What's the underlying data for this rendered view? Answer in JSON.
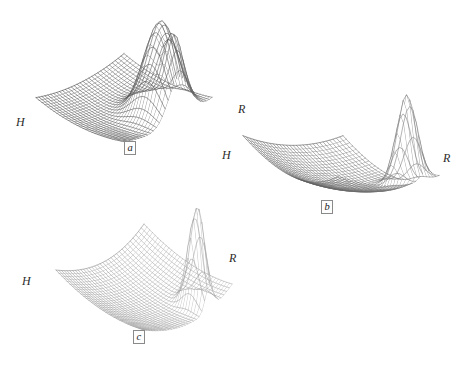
{
  "figure": {
    "type": "multi-panel-3d-surface-figure",
    "background_color": "#ffffff",
    "ink_color": "#303030",
    "panel_count": 3
  },
  "chart_data": {
    "type": "surface",
    "title": "",
    "subtitle": "",
    "xlabel": "R",
    "ylabel": "H",
    "zlabel": "",
    "grid": true,
    "legend_position": "none",
    "render_style": "wireframe-mesh",
    "projection": "oblique-3d",
    "panels": [
      {
        "id": "a",
        "tag": "a",
        "axis_left_label": "H",
        "axis_right_label": "R",
        "surface_tone": "dark",
        "mesh_rows": 30,
        "mesh_cols": 30,
        "base_level": 0.0,
        "peaks": [
          {
            "name": "primary-peak",
            "x": 0.62,
            "y": 0.8,
            "height": 1.0,
            "sigma_x": 0.12,
            "sigma_y": 0.16
          },
          {
            "name": "secondary-peak",
            "x": 0.83,
            "y": 0.74,
            "height": 0.52,
            "sigma_x": 0.055,
            "sigma_y": 0.085
          }
        ],
        "corner_screen_positions": {
          "left_H": [
            33,
            122
          ],
          "right_R": [
            214,
            110
          ],
          "front": [
            128,
            156
          ],
          "back": [
            118,
            66
          ]
        }
      },
      {
        "id": "b",
        "tag": "b",
        "axis_left_label": "H",
        "axis_right_label": "R",
        "surface_tone": "medium-dark",
        "mesh_rows": 30,
        "mesh_cols": 30,
        "base_level": 0.0,
        "peaks": [
          {
            "name": "primary-peak",
            "x": 0.87,
            "y": 0.8,
            "height": 1.0,
            "sigma_x": 0.055,
            "sigma_y": 0.095
          }
        ],
        "ridge": {
          "name": "back-ridge",
          "amplitude": 0.3,
          "axis": "y"
        },
        "corner_screen_positions": {
          "left_H": [
            240,
            155
          ],
          "right_R": [
            436,
            160
          ],
          "front": [
            328,
            222
          ],
          "back": [
            318,
            92
          ]
        }
      },
      {
        "id": "c",
        "tag": "c",
        "axis_left_label": "H",
        "axis_right_label": "R",
        "surface_tone": "light",
        "mesh_rows": 32,
        "mesh_cols": 32,
        "base_level": 0.0,
        "peaks": [
          {
            "name": "primary-peak",
            "x": 0.74,
            "y": 0.86,
            "height": 1.0,
            "sigma_x": 0.045,
            "sigma_y": 0.085
          }
        ],
        "ridge": {
          "name": "right-rise",
          "amplitude": 0.22,
          "axis": "x"
        },
        "corner_screen_positions": {
          "left_H": [
            55,
            285
          ],
          "right_R": [
            222,
            260
          ],
          "front": [
            142,
            345
          ],
          "back": [
            136,
            200
          ]
        }
      }
    ]
  },
  "panels": {
    "a": {
      "tag": "a",
      "label_H": "H",
      "label_R": "R"
    },
    "b": {
      "tag": "b",
      "label_H": "H",
      "label_R": "R"
    },
    "c": {
      "tag": "c",
      "label_H": "H",
      "label_R": "R"
    }
  }
}
